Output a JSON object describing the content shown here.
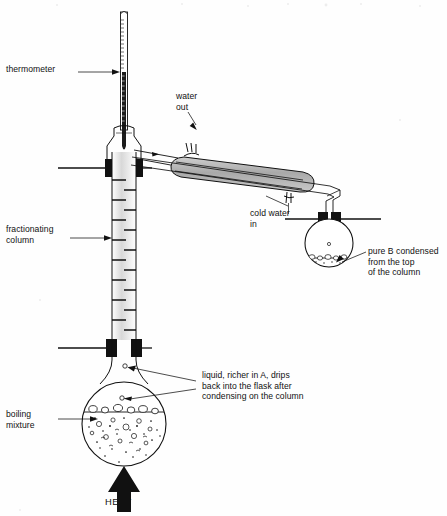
{
  "figure": {
    "background_color": "#ffffff",
    "ink_color": "#111111",
    "shade_color": "#b8b8b8"
  },
  "labels": {
    "thermometer": "thermometer",
    "fractionating_column": "fractionating\ncolumn",
    "boiling_mixture": "boiling\nmixture",
    "water_out": "water\nout",
    "cold_water_in": "cold water\nin",
    "pure_b": "pure B condensed\nfrom the top\nof the column",
    "reflux": "liquid, richer in A, drips\nback into the flask after\ncondensing on the column",
    "heat": "HEAT"
  },
  "parts": {
    "thermometer": "thermometer",
    "still_head": "still-head",
    "column": "fractionating-column",
    "condenser": "liebig-condenser",
    "water_inlet": "condenser-water-inlet",
    "water_outlet": "condenser-water-outlet",
    "receiver_flask": "receiving-flask",
    "boiling_flask": "boiling-flask",
    "heat_arrow": "heat-arrow",
    "clamp_upper": "clamp-upper",
    "clamp_lower": "clamp-lower",
    "clamp_receiver": "clamp-receiver"
  }
}
